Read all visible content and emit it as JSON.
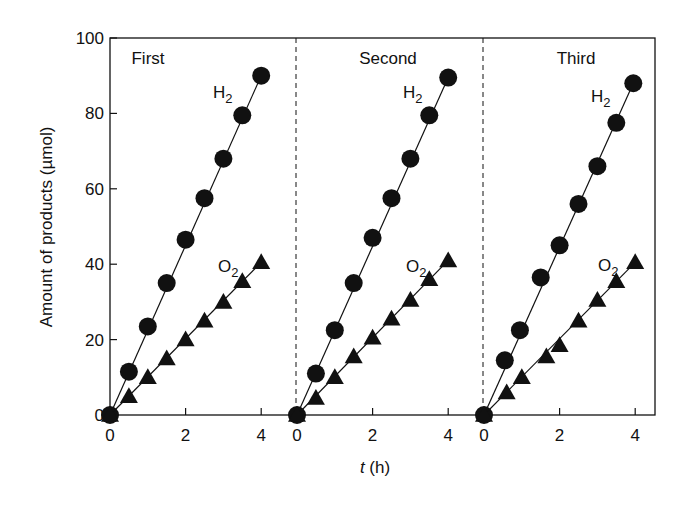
{
  "chart_data": {
    "type": "scatter",
    "title": "",
    "xlabel_italic": "t",
    "xlabel_rest": " (h)",
    "xlabel": "t (h)",
    "ylabel": "Amount of products (µmol)",
    "ylim": [
      0,
      100
    ],
    "xlim": [
      0,
      4.5
    ],
    "yticks": [
      0,
      20,
      40,
      60,
      80,
      100
    ],
    "xticks": [
      0,
      2,
      4
    ],
    "grid": false,
    "legend": "inline labels (H2 near top of circle series, O2 near top of triangle series)",
    "panels": [
      {
        "label": "First",
        "series": [
          {
            "name": "H2",
            "marker": "filled-circle",
            "x": [
              0,
              0.5,
              1.0,
              1.5,
              2.0,
              2.5,
              3.0,
              3.5,
              4.0
            ],
            "y": [
              0,
              11.5,
              23.5,
              35,
              46.5,
              57.5,
              68,
              79.5,
              90
            ]
          },
          {
            "name": "O2",
            "marker": "filled-triangle",
            "x": [
              0,
              0.5,
              1.0,
              1.5,
              2.0,
              2.5,
              3.0,
              3.5,
              4.0
            ],
            "y": [
              0,
              5,
              10,
              15,
              20,
              25,
              30,
              35.5,
              40.5
            ]
          }
        ]
      },
      {
        "label": "Second",
        "series": [
          {
            "name": "H2",
            "marker": "filled-circle",
            "x": [
              0,
              0.5,
              1.0,
              1.5,
              2.0,
              2.5,
              3.0,
              3.5,
              4.0
            ],
            "y": [
              0,
              11,
              22.5,
              35,
              47,
              57.5,
              68,
              79.5,
              89.5
            ]
          },
          {
            "name": "O2",
            "marker": "filled-triangle",
            "x": [
              0,
              0.5,
              1.0,
              1.5,
              2.0,
              2.5,
              3.0,
              3.5,
              4.0
            ],
            "y": [
              0,
              4.5,
              10,
              15.5,
              20.5,
              25.5,
              30.5,
              36,
              41
            ]
          }
        ]
      },
      {
        "label": "Third",
        "series": [
          {
            "name": "H2",
            "marker": "filled-circle",
            "x": [
              0,
              0.55,
              0.95,
              1.5,
              2.0,
              2.5,
              3.0,
              3.5,
              3.95
            ],
            "y": [
              0,
              14.5,
              22.5,
              36.5,
              45,
              56,
              66,
              77.5,
              88
            ]
          },
          {
            "name": "O2",
            "marker": "filled-triangle",
            "x": [
              0,
              0.6,
              1.0,
              1.65,
              2.0,
              2.5,
              3.0,
              3.5,
              4.0
            ],
            "y": [
              0,
              6,
              10,
              15.5,
              18.5,
              25,
              30.5,
              35.5,
              40.5
            ]
          }
        ]
      }
    ],
    "series_labels": {
      "h2_main": "H",
      "h2_sub": "2",
      "o2_main": "O",
      "o2_sub": "2"
    }
  }
}
